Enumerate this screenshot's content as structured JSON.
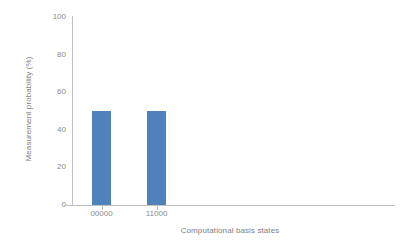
{
  "chart_data": {
    "type": "bar",
    "title": "",
    "xlabel": "Computational basis states",
    "ylabel": "Measurement probability (%)",
    "categories": [
      "00000",
      "11000"
    ],
    "values": [
      50,
      50
    ],
    "series": [
      {
        "name": "Measurement probability",
        "values": [
          50,
          50
        ]
      }
    ],
    "ylim": [
      0,
      100
    ],
    "yticks": [
      0,
      20,
      40,
      60,
      80,
      100
    ],
    "ytick_labels": [
      "0",
      "20",
      "40",
      "60",
      "80",
      "100"
    ],
    "grid": false,
    "legend": "none",
    "bar_color": "#4f81bd",
    "axis_color": "#bfbfbf",
    "text_color": "#808080",
    "background": "#ffffff"
  },
  "axes": {
    "y_title": "Measurement probability (%)",
    "x_title": "Computational basis states"
  }
}
